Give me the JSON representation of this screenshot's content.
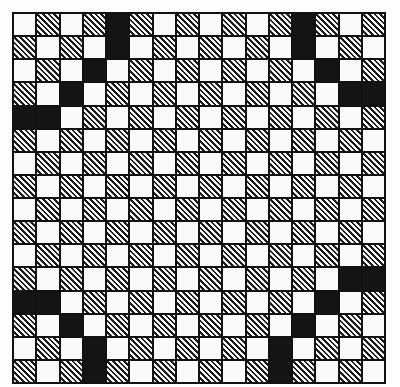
{
  "board": {
    "rows": 16,
    "cols": 16,
    "base_pattern": "checkerboard: white where (row+col) even, hatched where (row+col) odd",
    "cell_types": [
      "white",
      "hatched",
      "black"
    ],
    "black_cells": [
      [
        0,
        4
      ],
      [
        1,
        4
      ],
      [
        2,
        3
      ],
      [
        3,
        2
      ],
      [
        4,
        0
      ],
      [
        4,
        1
      ],
      [
        0,
        12
      ],
      [
        1,
        12
      ],
      [
        2,
        13
      ],
      [
        3,
        14
      ],
      [
        3,
        15
      ],
      [
        12,
        0
      ],
      [
        12,
        1
      ],
      [
        13,
        2
      ],
      [
        14,
        3
      ],
      [
        15,
        3
      ],
      [
        11,
        14
      ],
      [
        11,
        15
      ],
      [
        12,
        13
      ],
      [
        13,
        12
      ],
      [
        14,
        11
      ],
      [
        15,
        11
      ]
    ],
    "colors": {
      "white": "#fafaf8",
      "hatch": "#1a1a1a",
      "black": "#141414",
      "grid_line": "#111111"
    }
  }
}
